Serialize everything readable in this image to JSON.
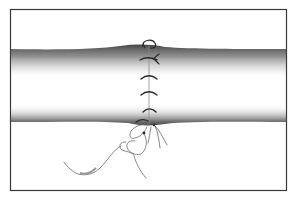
{
  "figure": {
    "colors": {
      "background": "#ffffff",
      "frame": "#3a3a3a",
      "tube_shadow_dark": "#3c3c3c",
      "suture": "#2a2a2a",
      "thread_loose": "#6a6a6a"
    },
    "frame": {
      "x": 10,
      "y": 9,
      "width": 276,
      "height": 181
    },
    "stitch_count": 5
  }
}
